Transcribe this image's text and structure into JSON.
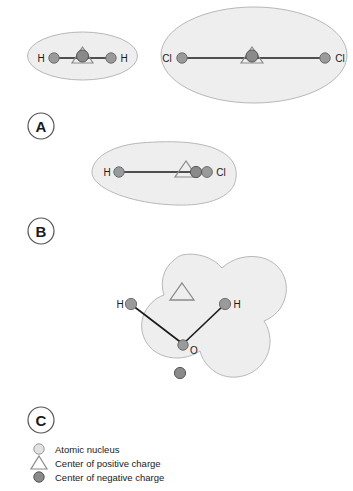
{
  "figure": {
    "background_color": "#ffffff",
    "cloud_fill": "#eeeeee",
    "cloud_stroke": "#b8b8b8",
    "nucleus_color": "#9a9a9a",
    "nucleus_stroke": "#6e6e6e",
    "negative_center_color": "#8a8a8a",
    "negative_center_stroke": "#555555",
    "positive_center_stroke": "#8a8a8a",
    "bond_color": "#1a1a1a"
  },
  "panels": [
    {
      "id": "panel-a",
      "label": "A",
      "molecules": [
        {
          "id": "hydrogen",
          "cloud_shape": "ellipse",
          "atoms": [
            {
              "label": "H",
              "label_side": "left"
            },
            {
              "label": "H",
              "label_side": "right"
            }
          ],
          "positive_center": "coincident-with-negative",
          "negative_center": "bond-midpoint"
        },
        {
          "id": "chlorine",
          "cloud_shape": "ellipse",
          "atoms": [
            {
              "label": "Cl",
              "label_side": "left"
            },
            {
              "label": "Cl",
              "label_side": "right"
            }
          ],
          "positive_center": "coincident-with-negative",
          "negative_center": "bond-midpoint"
        }
      ]
    },
    {
      "id": "panel-b",
      "label": "B",
      "molecules": [
        {
          "id": "hydrogen-chloride",
          "cloud_shape": "teardrop",
          "atoms": [
            {
              "label": "H",
              "label_side": "left"
            },
            {
              "label": "Cl",
              "label_side": "right"
            }
          ],
          "positive_center": "offset-toward-hydrogen",
          "negative_center": "offset-toward-chlorine"
        }
      ]
    },
    {
      "id": "panel-c",
      "label": "C",
      "molecules": [
        {
          "id": "water",
          "cloud_shape": "trefoil",
          "atoms": [
            {
              "label": "H",
              "label_side": "left"
            },
            {
              "label": "H",
              "label_side": "right"
            },
            {
              "label": "O",
              "label_side": "right"
            }
          ],
          "positive_center": "above-oxygen",
          "negative_center": "below-oxygen"
        }
      ]
    }
  ],
  "legend": {
    "items": [
      {
        "marker": "nucleus-circle",
        "label": "Atomic nucleus"
      },
      {
        "marker": "positive-triangle",
        "label": "Center of positive charge"
      },
      {
        "marker": "negative-circle",
        "label": "Center of negative charge"
      }
    ]
  }
}
